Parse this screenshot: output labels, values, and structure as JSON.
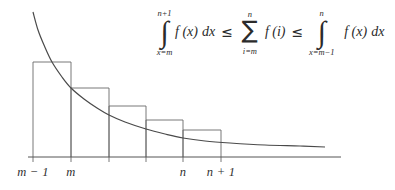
{
  "figure": {
    "background_color": "#ffffff",
    "stroke_color": "#555555",
    "axis": {
      "tick_labels": [
        {
          "text": "m − 1",
          "x": 33
        },
        {
          "text": "m",
          "x": 71
        },
        {
          "text": "n",
          "x": 183
        },
        {
          "text": "n + 1",
          "x": 221
        }
      ]
    },
    "formula": {
      "left_integral": {
        "symbol": "∫",
        "upper_limit": "n+1",
        "lower_limit": "x=m",
        "integrand": "f (x)",
        "differential": "dx"
      },
      "relation_1": "≤",
      "sum": {
        "symbol": "∑",
        "upper_limit": "n",
        "lower_limit": "i=m",
        "summand": "f (i)"
      },
      "relation_2": "≤",
      "right_integral": {
        "symbol": "∫",
        "upper_limit": "n",
        "lower_limit": "x=m−1",
        "integrand": "f (x)",
        "differential": "dx"
      }
    }
  },
  "chart_data": {
    "type": "bar",
    "title": "",
    "xlabel": "",
    "ylabel": "",
    "grid": false,
    "legend": null,
    "categories": [
      "m-1",
      "m",
      "m+1",
      "...",
      "n"
    ],
    "bar_left_edges": [
      33,
      71,
      109,
      146,
      183
    ],
    "bar_right_edges": [
      71,
      109,
      146,
      183,
      221
    ],
    "bar_top_y": [
      62,
      88,
      106,
      120,
      130
    ],
    "baseline_y": 157,
    "values": [
      95,
      69,
      51,
      37,
      27
    ],
    "curve": {
      "type": "line",
      "points": [
        [
          33,
          12
        ],
        [
          38,
          30
        ],
        [
          44,
          45
        ],
        [
          52,
          62
        ],
        [
          62,
          77
        ],
        [
          71,
          88
        ],
        [
          84,
          99
        ],
        [
          97,
          108
        ],
        [
          109,
          115
        ],
        [
          125,
          122
        ],
        [
          146,
          129
        ],
        [
          165,
          134
        ],
        [
          183,
          138
        ],
        [
          205,
          141
        ],
        [
          230,
          143
        ],
        [
          265,
          145
        ],
        [
          300,
          146
        ],
        [
          325,
          147
        ]
      ]
    },
    "axis_x_start": 28,
    "axis_x_end": 341,
    "xlim": [
      28,
      341
    ],
    "ylim": [
      157,
      12
    ]
  }
}
